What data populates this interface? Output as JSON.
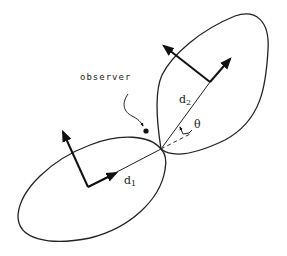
{
  "diagram": {
    "observer_label": "observer",
    "d1_label": "d",
    "d1_sub": "1",
    "d2_label": "d",
    "d2_sub": "2",
    "theta_label": "θ"
  }
}
